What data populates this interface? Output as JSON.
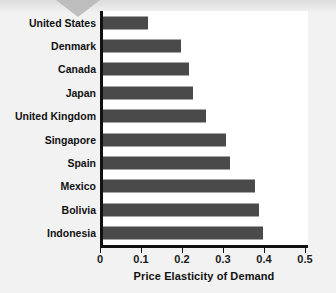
{
  "figure": {
    "background_color": "#f2f2f2",
    "panel_color": "#ffffff",
    "bar_color": "#4a4a4a",
    "axis_color": "#111111"
  },
  "chart_data": {
    "type": "bar",
    "orientation": "horizontal",
    "title": "",
    "subtitle": "",
    "xlabel": "Price Elasticity of Demand",
    "ylabel": "",
    "xlim": [
      0,
      0.5
    ],
    "xticks": [
      "0",
      "0.1",
      "0.2",
      "0.3",
      "0.4",
      "0.5"
    ],
    "xtick_values": [
      0,
      0.1,
      0.2,
      0.3,
      0.4,
      0.5
    ],
    "grid": false,
    "legend": false,
    "categories": [
      "United States",
      "Denmark",
      "Canada",
      "Japan",
      "United Kingdom",
      "Singapore",
      "Spain",
      "Mexico",
      "Bolivia",
      "Indonesia"
    ],
    "values": [
      0.11,
      0.19,
      0.21,
      0.22,
      0.25,
      0.3,
      0.31,
      0.37,
      0.38,
      0.39
    ],
    "series": [
      {
        "name": "Price Elasticity of Demand",
        "values": [
          0.11,
          0.19,
          0.21,
          0.22,
          0.25,
          0.3,
          0.31,
          0.37,
          0.38,
          0.39
        ]
      }
    ]
  }
}
